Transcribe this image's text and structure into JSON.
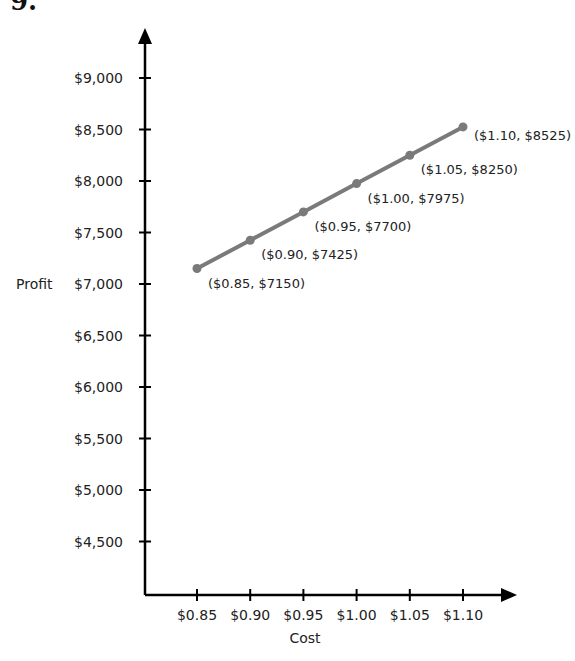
{
  "question_number": "9.",
  "chart_data": {
    "type": "line",
    "title": "",
    "xlabel": "Cost",
    "ylabel": "Profit",
    "x_tick_labels": [
      "$0.85",
      "$0.90",
      "$0.95",
      "$1.00",
      "$1.05",
      "$1.10"
    ],
    "y_tick_labels": [
      "$4,500",
      "$5,000",
      "$5,500",
      "$6,000",
      "$6,500",
      "$7,000",
      "$7,500",
      "$8,000",
      "$8,500",
      "$9,000"
    ],
    "x": [
      0.85,
      0.9,
      0.95,
      1.0,
      1.05,
      1.1
    ],
    "values": [
      7150,
      7425,
      7700,
      7975,
      8250,
      8525
    ],
    "point_labels": [
      "($0.85, $7150)",
      "($0.90, $7425)",
      "($0.95, $7700)",
      "($1.00, $7975)",
      "($1.05, $8250)",
      "($1.10, $8525)"
    ],
    "ylim": [
      4000,
      9500
    ],
    "grid": false,
    "legend": null,
    "line_color": "#7a7a7a"
  }
}
